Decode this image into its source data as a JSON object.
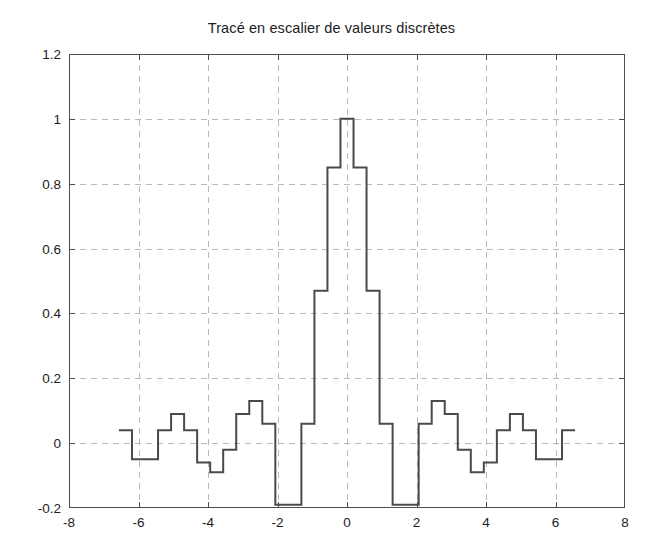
{
  "chart": {
    "title": "Tracé en escalier de valeurs discrètes",
    "background_color": "#ffffff",
    "axis_color": "#4d4d4d",
    "grid_color": "#b9b9b9",
    "line_color": "#4a4a4a"
  },
  "axes": {
    "x_tick_labels": [
      "-8",
      "-6",
      "-4",
      "-2",
      "0",
      "2",
      "4",
      "6",
      "8"
    ],
    "y_tick_labels": [
      "1.2",
      "1",
      "0.8",
      "0.6",
      "0.4",
      "0.2",
      "0",
      "-0.2"
    ]
  },
  "chart_data": {
    "type": "line",
    "title": "Tracé en escalier de valeurs discrètes",
    "xlabel": "",
    "ylabel": "",
    "xlim": [
      -8,
      8
    ],
    "ylim": [
      -0.2,
      1.2
    ],
    "xticks": [
      -8,
      -6,
      -4,
      -2,
      0,
      2,
      4,
      6,
      8
    ],
    "yticks": [
      -0.2,
      0,
      0.2,
      0.4,
      0.6,
      0.8,
      1,
      1.2
    ],
    "grid": true,
    "grid_style": "dashed",
    "legend": null,
    "drawstyle": "steps-post",
    "series": [
      {
        "name": "sinc discrète",
        "x": [
          -6.375,
          -6.0,
          -5.625,
          -5.25,
          -4.875,
          -4.5,
          -4.125,
          -3.75,
          -3.375,
          -3.0,
          -2.625,
          -2.25,
          -1.875,
          -1.5,
          -1.125,
          -0.75,
          -0.375,
          0.0,
          0.375,
          0.75,
          1.125,
          1.5,
          1.875,
          2.25,
          2.625,
          3.0,
          3.375,
          3.75,
          4.125,
          4.5,
          4.875,
          5.25,
          5.625,
          6.0,
          6.375
        ],
        "y": [
          0.04,
          -0.05,
          -0.05,
          0.04,
          0.09,
          0.04,
          -0.06,
          -0.09,
          -0.02,
          0.09,
          0.13,
          0.06,
          -0.19,
          -0.19,
          0.06,
          0.47,
          0.85,
          1.0,
          0.85,
          0.47,
          0.06,
          -0.19,
          -0.19,
          0.06,
          0.13,
          0.09,
          -0.02,
          -0.09,
          -0.06,
          0.04,
          0.09,
          0.04,
          -0.05,
          -0.05,
          0.04
        ]
      }
    ]
  }
}
